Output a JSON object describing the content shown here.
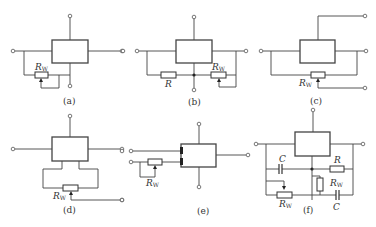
{
  "figure": {
    "subfigures": [
      {
        "id": "a",
        "caption": "(a)",
        "components": [
          {
            "type": "potentiometer",
            "label": "R",
            "subscript": "W"
          }
        ]
      },
      {
        "id": "b",
        "caption": "(b)",
        "components": [
          {
            "type": "resistor",
            "label": "R"
          },
          {
            "type": "potentiometer",
            "label": "R",
            "subscript": "W"
          }
        ]
      },
      {
        "id": "c",
        "caption": "(c)",
        "components": [
          {
            "type": "potentiometer",
            "label": "R",
            "subscript": "W"
          }
        ]
      },
      {
        "id": "d",
        "caption": "(d)",
        "components": [
          {
            "type": "potentiometer",
            "label": "R",
            "subscript": "W"
          }
        ]
      },
      {
        "id": "e",
        "caption": "(e)",
        "components": [
          {
            "type": "potentiometer",
            "label": "R",
            "subscript": "W"
          }
        ]
      },
      {
        "id": "f",
        "caption": "(f)",
        "components": [
          {
            "type": "capacitor",
            "label": "C"
          },
          {
            "type": "resistor",
            "label": "R"
          },
          {
            "type": "potentiometer",
            "label": "R",
            "subscript": "W"
          },
          {
            "type": "potentiometer",
            "label": "R",
            "subscript": "W"
          },
          {
            "type": "capacitor",
            "label": "C"
          }
        ]
      }
    ]
  },
  "labels": {
    "R": "R",
    "W": "W",
    "C": "C",
    "a": "(a)",
    "b": "(b)",
    "c": "(c)",
    "d": "(d)",
    "e": "(e)",
    "f": "(f)"
  },
  "colors": {
    "line": "#444444",
    "background": "#ffffff"
  }
}
